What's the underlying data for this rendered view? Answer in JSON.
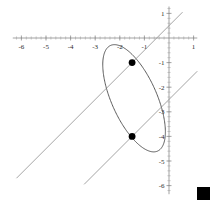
{
  "chart_data": {
    "type": "scatter",
    "title": "",
    "subtitle": "",
    "xlabel": "",
    "ylabel": "",
    "xlim": [
      -6.4,
      1.2
    ],
    "ylim": [
      -6.4,
      1.3
    ],
    "grid": false,
    "legend_position": "none",
    "x_ticks": [
      {
        "value": -6,
        "label": "-6"
      },
      {
        "value": -5,
        "label": "-5"
      },
      {
        "value": -4,
        "label": "-4"
      },
      {
        "value": -3,
        "label": "-3"
      },
      {
        "value": -2,
        "label": "-2"
      },
      {
        "value": -1,
        "label": "-1"
      },
      {
        "value": 1,
        "label": "1"
      }
    ],
    "y_ticks": [
      {
        "value": 1,
        "label": "1"
      },
      {
        "value": -1,
        "label": "-1"
      },
      {
        "value": -2,
        "label": "-2"
      },
      {
        "value": -3,
        "label": "-3"
      },
      {
        "value": -4,
        "label": "-4"
      },
      {
        "value": -5,
        "label": "-5"
      },
      {
        "value": -6,
        "label": "-6"
      }
    ],
    "x_minor_tick_step": 0.2,
    "y_minor_tick_step": 0.2,
    "series": [
      {
        "name": "ellipse",
        "type": "curve",
        "stroke": "#4a4a4a",
        "center": [
          -1.42,
          -2.45
        ],
        "semi_major": 2.35,
        "semi_minor": 0.92,
        "rotation_deg": -66
      },
      {
        "name": "tangent-line-upper",
        "type": "line",
        "stroke": "#8e8e8e",
        "slope": 1,
        "intercept": 0.5,
        "x_start": -6.2,
        "x_end": 0.55
      },
      {
        "name": "tangent-line-lower",
        "type": "line",
        "stroke": "#8e8e8e",
        "slope": 1,
        "intercept": -2.5,
        "x_start": -3.45,
        "x_end": 1.15
      }
    ],
    "points": [
      {
        "label": "upper-tangency-point",
        "x": -1.5,
        "y": -1.0
      },
      {
        "label": "lower-tangency-point",
        "x": -1.5,
        "y": -4.0
      }
    ],
    "annotations": [
      {
        "name": "corner-square-marker",
        "shape": "filled-square",
        "color": "#000000"
      }
    ]
  },
  "colors": {
    "axis": "#7d7d7d",
    "ellipse": "#4a4a4a",
    "line": "#8e8e8e",
    "point": "#000000",
    "background": "#ffffff"
  }
}
